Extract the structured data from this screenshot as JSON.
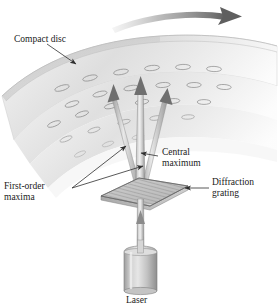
{
  "figure": {
    "background_color": "#ffffff",
    "width": 278,
    "height": 307
  },
  "labels": {
    "compact_disc": "Compact disc",
    "central_maximum_line1": "Central",
    "central_maximum_line2": "maximum",
    "first_order_line1": "First-order",
    "first_order_line2": "maxima",
    "diffraction_grating_line1": "Diffraction",
    "diffraction_grating_line2": "grating",
    "laser": "Laser"
  },
  "colors": {
    "text": "#1a1a1a",
    "leader_line": "#3a3a3a",
    "disc_light": "#ededed",
    "disc_mid": "#dcdcdc",
    "disc_dark": "#c4c4c4",
    "pit_outline": "#8f8f8f",
    "beam_light": "#e2e2e2",
    "beam_mid": "#b8b8b8",
    "beam_dark": "#8a8a8a",
    "grating_line": "#6e6e6e",
    "laser_body": "#c9c9c9",
    "rotation_arrow": "#6b6b6b"
  },
  "components": {
    "rotation_arrow": "curved-arrow-right",
    "disc": "compact-disc-band",
    "pits": "disc-pit-ellipses",
    "central_beam": "central-maximum-beam",
    "first_order_left": "first-order-maximum-beam-left",
    "first_order_right": "first-order-maximum-beam-right",
    "incident_beam": "incident-laser-beam",
    "grating": "diffraction-grating-slab",
    "laser": "laser-cylinder"
  }
}
